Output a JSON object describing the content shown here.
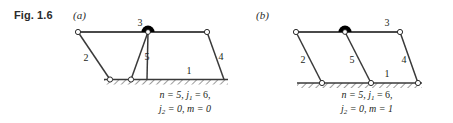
{
  "figure": {
    "label": "Fig. 1.6",
    "panels": [
      {
        "id": "a",
        "letter": "(a)",
        "link_labels": {
          "ground": "1",
          "left_crank": "2",
          "coupler": "3",
          "right_crank": "4",
          "middle_link": "5"
        },
        "caption": {
          "line1_pre": "n = 5, j",
          "line1_sub": "1",
          "line1_post": " = 6,",
          "line2_pre": "j",
          "line2_sub": "2",
          "line2_post": " = 0, m = 0",
          "n_value": "5",
          "j1_value": "6",
          "j2_value": "0",
          "m_value": "0"
        }
      },
      {
        "id": "b",
        "letter": "(b)",
        "link_labels": {
          "ground": "1",
          "left_crank": "2",
          "coupler": "3",
          "right_crank": "4",
          "middle_link": "5"
        },
        "caption": {
          "line1_pre": "n = 5, j",
          "line1_sub": "1",
          "line1_post": " = 6,",
          "line2_pre": "j",
          "line2_sub": "2",
          "line2_post": " = 0, m = 1",
          "n_value": "5",
          "j1_value": "6",
          "j2_value": "0",
          "m_value": "1"
        }
      }
    ],
    "icons": {
      "pin_joint": "open-circle-joint-icon",
      "fixed_joint": "filled-semicircle-joint-icon",
      "ground": "hatched-ground-icon"
    },
    "colors": {
      "line": "#3a3a3a",
      "joint_fill": "#ffffff",
      "joint_stroke": "#2b2b2b",
      "solid_joint": "#000000",
      "text": "#231f20",
      "ground_hatch": "#4a4a4a"
    }
  }
}
